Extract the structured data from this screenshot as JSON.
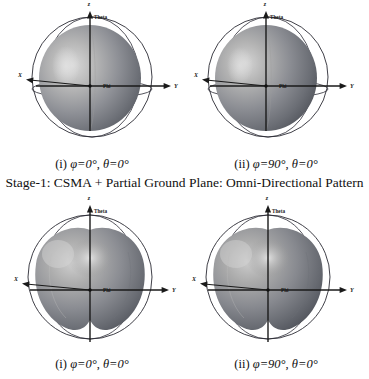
{
  "figure": {
    "main_caption": "Stage-1: CSMA + Partial Ground Plane: Omni-Directional Pattern",
    "axis_labels": {
      "z": "z",
      "y": "Y",
      "x": "X",
      "theta": "Theta",
      "phi": "Phi"
    },
    "rows": [
      {
        "id": "stage-1-omni-directional",
        "panels": [
          {
            "index": "(i)",
            "phi": "φ=0°",
            "theta": "θ=0°",
            "pattern": "omni-sphere"
          },
          {
            "index": "(ii)",
            "phi": "φ=90°",
            "theta": "θ=0°",
            "pattern": "omni-sphere"
          }
        ]
      },
      {
        "id": "stage-2-lobed",
        "panels": [
          {
            "index": "(i)",
            "phi": "φ=0°",
            "theta": "θ=0°",
            "pattern": "dimpled-lobed"
          },
          {
            "index": "(ii)",
            "phi": "φ=90°",
            "theta": "θ=0°",
            "pattern": "dimpled-lobed"
          }
        ]
      }
    ],
    "colors": {
      "background": "#ffffff",
      "outline": "#2a2a33",
      "axis": "#1a1a1a",
      "lobe_light": "#cfcfcf",
      "lobe_mid": "#9a9a9a",
      "lobe_dark": "#666a70",
      "lobe_darker": "#4a4e55"
    }
  }
}
